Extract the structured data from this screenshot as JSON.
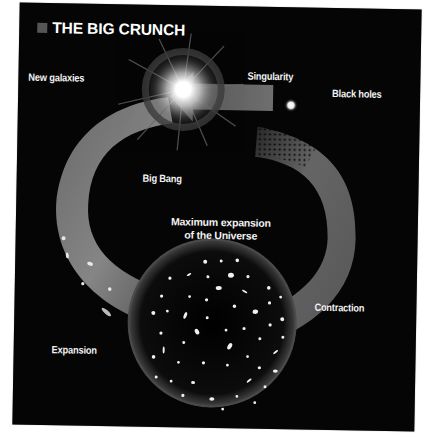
{
  "title": "THE BIG CRUNCH",
  "colors": {
    "background": "#050505",
    "text": "#f2f2f2",
    "title_square": "#555555",
    "arrow": "#8a8a8a",
    "glow": "#ffffff"
  },
  "labels": {
    "new_galaxies": "New galaxies",
    "singularity": "Singularity",
    "black_holes": "Black holes",
    "big_bang": "Big Bang",
    "max_expansion_line1": "Maximum expansion",
    "max_expansion_line2": "of the Universe",
    "contraction": "Contraction",
    "expansion": "Expansion"
  },
  "cycle": [
    {
      "stage": "Big Bang",
      "icon": "bright-star-icon"
    },
    {
      "stage": "Expansion",
      "icon": "expansion-arrow-icon"
    },
    {
      "stage": "Maximum expansion of the Universe",
      "icon": "universe-sphere-icon"
    },
    {
      "stage": "Contraction",
      "icon": "contraction-arrow-icon"
    },
    {
      "stage": "Black holes",
      "icon": "black-holes-dots-icon"
    },
    {
      "stage": "Singularity",
      "icon": "singularity-point-icon"
    }
  ]
}
